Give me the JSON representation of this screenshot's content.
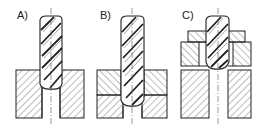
{
  "figure": {
    "panels": [
      {
        "id": "A",
        "label": "A)",
        "config": "single block with through-hole"
      },
      {
        "id": "B",
        "label": "B)",
        "config": "two stacked plates with through-hole"
      },
      {
        "id": "C",
        "label": "C)",
        "config": "clamping plates above base block with through-hole"
      }
    ]
  },
  "colors": {
    "line": "#222222",
    "background": "#ffffff"
  }
}
